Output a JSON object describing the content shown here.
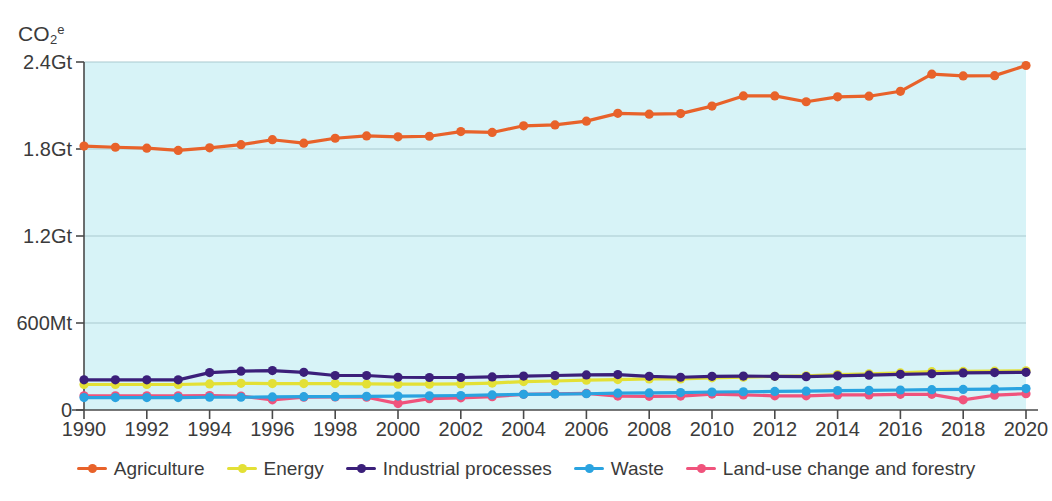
{
  "chart_data": {
    "type": "line",
    "title": "",
    "xlabel": "",
    "ylabel": "CO2e",
    "ylabel_parts": {
      "prefix": "CO",
      "sub": "2",
      "sup": "e"
    },
    "x": [
      1990,
      1991,
      1992,
      1993,
      1994,
      1995,
      1996,
      1997,
      1998,
      1999,
      2000,
      2001,
      2002,
      2003,
      2004,
      2005,
      2006,
      2007,
      2008,
      2009,
      2010,
      2011,
      2012,
      2013,
      2014,
      2015,
      2016,
      2017,
      2018,
      2019,
      2020
    ],
    "xtick_labels": [
      "1990",
      "1992",
      "1994",
      "1996",
      "1998",
      "2000",
      "2002",
      "2004",
      "2006",
      "2008",
      "2010",
      "2012",
      "2014",
      "2016",
      "2018",
      "2020"
    ],
    "xtick_values": [
      1990,
      1992,
      1994,
      1996,
      1998,
      2000,
      2002,
      2004,
      2006,
      2008,
      2010,
      2012,
      2014,
      2016,
      2018,
      2020
    ],
    "ytick_labels": [
      "0",
      "600Mt",
      "1.2Gt",
      "1.8Gt",
      "2.4Gt"
    ],
    "ytick_values": [
      0,
      600,
      1200,
      1800,
      2400
    ],
    "ylim": [
      0,
      2400
    ],
    "xlim": [
      1990,
      2020
    ],
    "grid": true,
    "legend_position": "bottom",
    "plot_bg": "#d7f3f7",
    "series": [
      {
        "name": "Agriculture",
        "color": "#e8622a",
        "values": [
          1820,
          1812,
          1806,
          1790,
          1808,
          1830,
          1864,
          1840,
          1874,
          1890,
          1884,
          1888,
          1920,
          1914,
          1960,
          1966,
          1992,
          2046,
          2040,
          2044,
          2096,
          2166,
          2166,
          2126,
          2160,
          2164,
          2198,
          2316,
          2304,
          2306,
          2376
        ]
      },
      {
        "name": "Energy",
        "color": "#e3e035",
        "values": [
          176,
          176,
          176,
          176,
          180,
          184,
          182,
          182,
          182,
          180,
          178,
          178,
          180,
          186,
          196,
          200,
          206,
          210,
          214,
          214,
          222,
          226,
          232,
          236,
          244,
          250,
          256,
          264,
          266,
          268,
          270
        ]
      },
      {
        "name": "Industrial processes",
        "color": "#3b1f7a",
        "values": [
          208,
          208,
          208,
          208,
          258,
          268,
          272,
          260,
          238,
          238,
          226,
          224,
          224,
          228,
          234,
          238,
          242,
          244,
          232,
          226,
          232,
          234,
          232,
          230,
          236,
          240,
          246,
          250,
          256,
          258,
          260
        ]
      },
      {
        "name": "Waste",
        "color": "#2aa3e0",
        "values": [
          86,
          86,
          86,
          86,
          88,
          88,
          90,
          92,
          92,
          94,
          96,
          98,
          100,
          104,
          108,
          110,
          112,
          116,
          118,
          120,
          124,
          126,
          128,
          130,
          134,
          136,
          138,
          140,
          142,
          144,
          148
        ]
      },
      {
        "name": "Land-use change and forestry",
        "color": "#f0537c",
        "values": [
          98,
          98,
          98,
          98,
          100,
          96,
          70,
          88,
          90,
          88,
          44,
          78,
          84,
          92,
          108,
          112,
          114,
          96,
          94,
          96,
          110,
          104,
          98,
          98,
          104,
          104,
          108,
          108,
          70,
          102,
          112
        ]
      }
    ]
  },
  "legend": {
    "items": [
      {
        "label": "Agriculture",
        "color": "#e8622a"
      },
      {
        "label": "Energy",
        "color": "#e3e035"
      },
      {
        "label": "Industrial processes",
        "color": "#3b1f7a"
      },
      {
        "label": "Waste",
        "color": "#2aa3e0"
      },
      {
        "label": "Land-use change and forestry",
        "color": "#f0537c"
      }
    ]
  }
}
